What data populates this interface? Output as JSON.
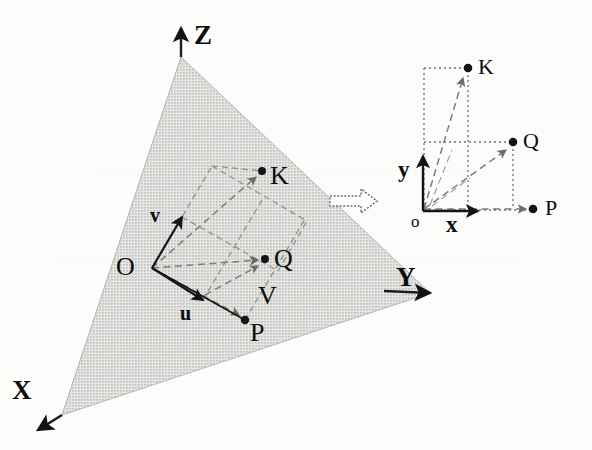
{
  "figure": {
    "background_color": "#fdfdfc",
    "ink_color": "#0d0d0d",
    "plane_fill": "#d2d2d0",
    "dashed_color": "#8d8d8a",
    "dotted_color": "#6f6f6c"
  },
  "left_panel": {
    "name": "3d-plane-panel",
    "axes": [
      {
        "id": "z",
        "label": "Z",
        "direction": "up"
      },
      {
        "id": "y",
        "label": "Y",
        "direction": "right"
      },
      {
        "id": "x",
        "label": "X",
        "direction": "down-left"
      }
    ],
    "origin_label": "O",
    "vectors": [
      {
        "id": "v",
        "label": "v",
        "from": "O",
        "direction": "up-right"
      },
      {
        "id": "u",
        "label": "u",
        "from": "O",
        "direction": "down-right"
      }
    ],
    "points": [
      {
        "id": "K",
        "label": "K"
      },
      {
        "id": "Q",
        "label": "Q"
      },
      {
        "id": "P",
        "label": "P"
      }
    ],
    "extra_labels": [
      {
        "id": "V",
        "label": "V"
      }
    ]
  },
  "transform_arrow": {
    "name": "transform-arrow",
    "glyph": "hollow-right-arrow"
  },
  "right_panel": {
    "name": "2d-coordinate-panel",
    "origin_label": "o",
    "axes": [
      {
        "id": "x",
        "label": "x",
        "direction": "right"
      },
      {
        "id": "y",
        "label": "y",
        "direction": "up"
      }
    ],
    "points": [
      {
        "id": "K",
        "label": "K"
      },
      {
        "id": "Q",
        "label": "Q"
      },
      {
        "id": "P",
        "label": "P"
      }
    ]
  }
}
